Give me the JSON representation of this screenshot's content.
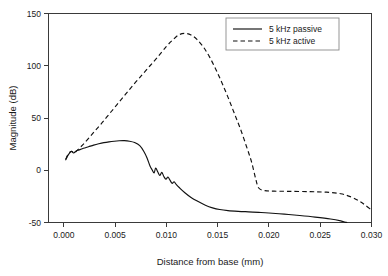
{
  "chart_data": {
    "type": "line",
    "title": "",
    "xlabel": "Distance from base (mm)",
    "ylabel": "Magnitude (dB)",
    "xlim": [
      -0.0015,
      0.03
    ],
    "ylim": [
      -50,
      150
    ],
    "xticks": [
      0.0,
      0.005,
      0.01,
      0.015,
      0.02,
      0.025,
      0.03
    ],
    "xtick_labels": [
      "0.000",
      "0.005",
      "0.010",
      "0.015",
      "0.020",
      "0.025",
      "0.030"
    ],
    "yticks": [
      -50,
      0,
      50,
      100,
      150
    ],
    "ytick_labels": [
      "-50",
      "0",
      "50",
      "100",
      "150"
    ],
    "grid": false,
    "legend_position": "top-right",
    "legend_entries": [
      {
        "label": "5 kHz passive",
        "style": "solid"
      },
      {
        "label": "5 kHz active",
        "style": "dashed"
      }
    ],
    "series": [
      {
        "name": "5 kHz passive",
        "style": "solid",
        "x": [
          0.00018,
          0.00035,
          0.00055,
          0.00075,
          0.00095,
          0.0012,
          0.0015,
          0.0019,
          0.0024,
          0.0029,
          0.0034,
          0.0039,
          0.0044,
          0.0049,
          0.0054,
          0.0059,
          0.0064,
          0.0069,
          0.0074,
          0.0078,
          0.0081,
          0.0084,
          0.0086,
          0.0088,
          0.00895,
          0.00915,
          0.00935,
          0.00955,
          0.00975,
          0.00995,
          0.01015,
          0.01035,
          0.01055,
          0.01075,
          0.01095,
          0.0113,
          0.0118,
          0.0124,
          0.0131,
          0.0138,
          0.0145,
          0.0152,
          0.016,
          0.017,
          0.018,
          0.019,
          0.02,
          0.0215,
          0.023,
          0.0245,
          0.026,
          0.027,
          0.0274,
          0.0276
        ],
        "y": [
          10.0,
          13.5,
          16.5,
          18.0,
          16.5,
          18.5,
          19.5,
          21.0,
          22.5,
          24.0,
          25.3,
          26.4,
          27.2,
          27.8,
          28.2,
          28.3,
          27.8,
          26.5,
          23.5,
          18.0,
          12.0,
          4.0,
          0.5,
          -2.5,
          2.0,
          -1.5,
          -5.0,
          -2.0,
          -6.0,
          -8.5,
          -6.5,
          -9.5,
          -12.5,
          -11.0,
          -13.5,
          -17.0,
          -21.5,
          -26.0,
          -30.0,
          -33.5,
          -36.0,
          -37.6,
          -38.6,
          -39.3,
          -39.8,
          -40.3,
          -40.9,
          -42.0,
          -43.3,
          -44.8,
          -46.6,
          -48.4,
          -49.6,
          -50.0
        ]
      },
      {
        "name": "5 kHz active",
        "style": "dashed",
        "x": [
          0.00018,
          0.0004,
          0.0006,
          0.0008,
          0.001,
          0.0014,
          0.002,
          0.0028,
          0.0036,
          0.0044,
          0.0052,
          0.006,
          0.0068,
          0.0076,
          0.0084,
          0.0092,
          0.01,
          0.0106,
          0.0112,
          0.0118,
          0.0124,
          0.013,
          0.0136,
          0.0142,
          0.0148,
          0.0154,
          0.016,
          0.0166,
          0.0172,
          0.0178,
          0.0183,
          0.0187,
          0.019,
          0.0196,
          0.0205,
          0.022,
          0.024,
          0.0256,
          0.027,
          0.028,
          0.0288,
          0.0294,
          0.03
        ],
        "y": [
          10.5,
          15.0,
          17.5,
          18.0,
          16.5,
          20.0,
          26.0,
          35.0,
          44.0,
          53.5,
          63.0,
          72.5,
          82.0,
          91.0,
          100.0,
          109.0,
          118.5,
          124.5,
          129.5,
          131.0,
          129.5,
          125.0,
          118.0,
          108.5,
          97.0,
          84.0,
          70.0,
          55.0,
          40.0,
          23.0,
          8.0,
          -8.0,
          -17.0,
          -19.5,
          -20.0,
          -20.2,
          -20.5,
          -21.0,
          -22.5,
          -25.5,
          -29.5,
          -33.5,
          -38.0
        ]
      }
    ]
  }
}
